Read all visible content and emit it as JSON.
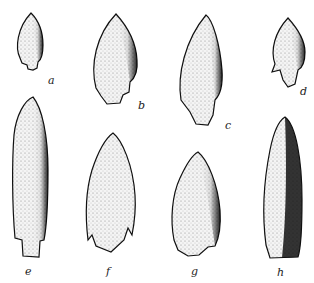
{
  "figure": {
    "caption_fragment": "",
    "labels": [
      "a",
      "b",
      "c",
      "d",
      "e",
      "f",
      "g",
      "h"
    ]
  }
}
